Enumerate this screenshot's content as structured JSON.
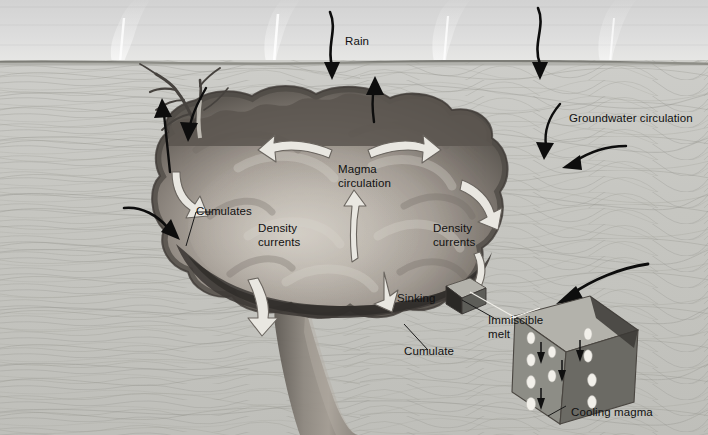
{
  "figure": {
    "type": "geological-cross-section",
    "colors": {
      "sky": "#d9d9d9",
      "rock": "#c8c8c4",
      "magma_light": "#b9b4ad",
      "magma_dark": "#6f6a64",
      "magma_edge": "#514c48",
      "arrow_white": "#e8e6e0",
      "arrow_black": "#101010",
      "cube_front": "#8d8d86",
      "cube_side": "#5d5d58",
      "cube_top": "#b3b2ab",
      "droplet": "#f2f0ea"
    }
  },
  "labels": {
    "rain": "Rain",
    "groundwater": "Groundwater circulation",
    "magma_circulation_l1": "Magma",
    "magma_circulation_l2": "circulation",
    "cumulates": "Cumulates",
    "density_left_l1": "Density",
    "density_left_l2": "currents",
    "density_right_l1": "Density",
    "density_right_l2": "currents",
    "sinking": "Sinking",
    "cumulate": "Cumulate",
    "immiscible_l1": "Immiscible",
    "immiscible_l2": "melt",
    "cooling_magma": "Cooling magma"
  },
  "annotations": {
    "rain_arrows": 2,
    "groundwater_arrows": 2,
    "white_circulation_arrows": 7,
    "steam_plumes": 4,
    "cube_droplets": 10,
    "cube_arrows": 4
  }
}
